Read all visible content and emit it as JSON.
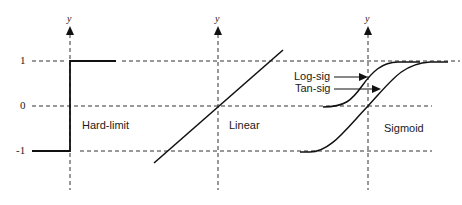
{
  "diagram": {
    "title": "",
    "y_tick_labels": [
      {
        "label": "1",
        "value": 1
      },
      {
        "label": "0",
        "value": 0
      },
      {
        "label": "-1",
        "value": -1
      }
    ],
    "axis_label": "y",
    "panels": [
      {
        "name": "hard-limit",
        "label": "Hard-limit"
      },
      {
        "name": "linear",
        "label": "Linear"
      },
      {
        "name": "sigmoid",
        "label": "Sigmoid",
        "curves": [
          {
            "name": "log-sig",
            "label": "Log-sig",
            "range": [
              0,
              1
            ]
          },
          {
            "name": "tan-sig",
            "label": "Tan-sig",
            "range": [
              -1,
              1
            ]
          }
        ]
      }
    ],
    "colors": {
      "line": "#1a1a1a",
      "dashed": "#333333",
      "background": "#ffffff"
    }
  }
}
